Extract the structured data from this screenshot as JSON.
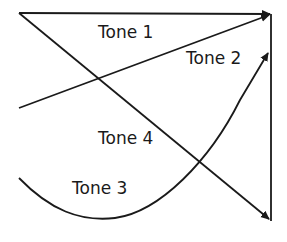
{
  "diagram": {
    "title": "",
    "labels": [
      {
        "id": "tone1",
        "text": "Tone 1",
        "x": 98,
        "y": 38
      },
      {
        "id": "tone2",
        "text": "Tone 2",
        "x": 186,
        "y": 64
      },
      {
        "id": "tone4",
        "text": "Tone 4",
        "x": 98,
        "y": 144
      },
      {
        "id": "tone3",
        "text": "Tone 3",
        "x": 72,
        "y": 194
      }
    ],
    "colors": {
      "stroke": "#1a1a1a",
      "background": "#ffffff"
    }
  }
}
